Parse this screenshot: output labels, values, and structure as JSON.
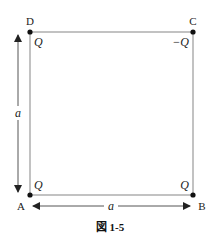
{
  "figure": {
    "caption": "図 1-5",
    "caption_prefix": "図",
    "caption_number": "1-5"
  },
  "corners": {
    "A": {
      "label": "A",
      "charge": "Q"
    },
    "B": {
      "label": "B",
      "charge": "Q"
    },
    "C": {
      "label": "C",
      "charge": "−Q"
    },
    "D": {
      "label": "D",
      "charge": "Q"
    }
  },
  "dimensions": {
    "side_vertical": "a",
    "side_horizontal": "a"
  },
  "colors": {
    "square_line": "#999999",
    "arrow_line": "#444444",
    "dot": "#111111",
    "text": "#222222"
  }
}
